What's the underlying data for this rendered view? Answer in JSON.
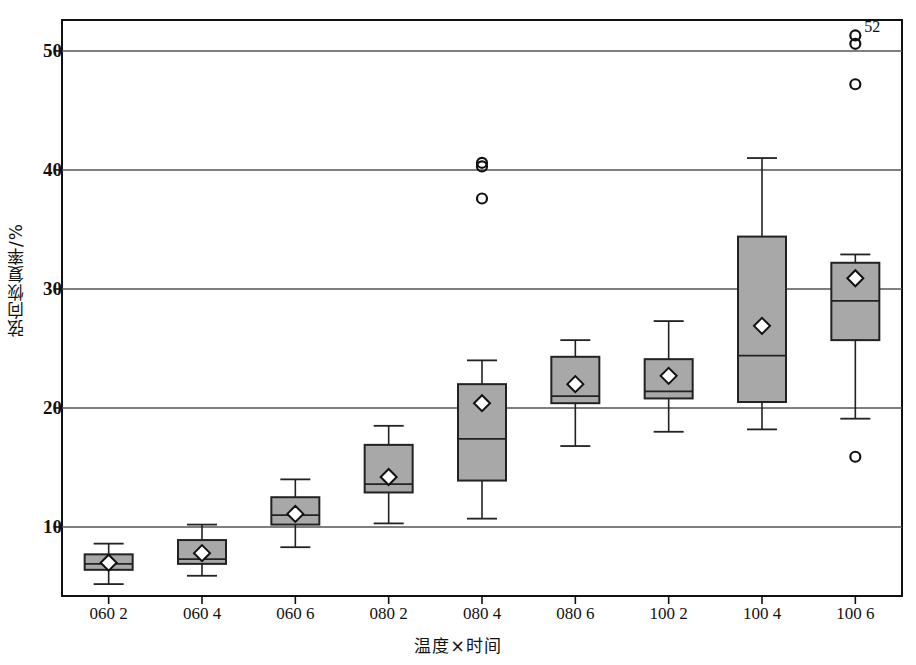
{
  "chart_data": {
    "type": "boxplot",
    "title": "",
    "xlabel": "温度×时间",
    "ylabel": "弦向恢复率/%",
    "categories": [
      "060 2",
      "060 4",
      "060 6",
      "080 2",
      "080 4",
      "080 6",
      "100 2",
      "100 4",
      "100 6"
    ],
    "ylim": [
      4.2,
      52.6
    ],
    "yticks": [
      10,
      20,
      30,
      40,
      50
    ],
    "ytick_labels": [
      "10",
      "20",
      "30",
      "40",
      "50"
    ],
    "grid": "horizontal",
    "legend": "none",
    "box_fill_color": "#a8a8a8",
    "box_edge_color": "#222222",
    "mean_marker": "diamond",
    "boxes": [
      {
        "category": "060 2",
        "whisker_low": 5.2,
        "q1": 6.4,
        "median": 6.9,
        "q3": 7.7,
        "whisker_high": 8.6,
        "mean": 7.0,
        "outliers": []
      },
      {
        "category": "060 4",
        "whisker_low": 5.9,
        "q1": 6.9,
        "median": 7.3,
        "q3": 8.9,
        "whisker_high": 10.2,
        "mean": 7.8,
        "outliers": []
      },
      {
        "category": "060 6",
        "whisker_low": 8.3,
        "q1": 10.2,
        "median": 11.0,
        "q3": 12.5,
        "whisker_high": 14.0,
        "mean": 11.1,
        "outliers": []
      },
      {
        "category": "080 2",
        "whisker_low": 10.3,
        "q1": 12.9,
        "median": 13.6,
        "q3": 16.9,
        "whisker_high": 18.5,
        "mean": 14.2,
        "outliers": []
      },
      {
        "category": "080 4",
        "whisker_low": 10.7,
        "q1": 13.9,
        "median": 17.4,
        "q3": 22.0,
        "whisker_high": 24.0,
        "mean": 20.4,
        "outliers": [
          37.6,
          40.3,
          40.6
        ]
      },
      {
        "category": "080 6",
        "whisker_low": 16.8,
        "q1": 20.4,
        "median": 21.0,
        "q3": 24.3,
        "whisker_high": 25.7,
        "mean": 22.0,
        "outliers": []
      },
      {
        "category": "100 2",
        "whisker_low": 18.0,
        "q1": 20.8,
        "median": 21.4,
        "q3": 24.1,
        "whisker_high": 27.3,
        "mean": 22.7,
        "outliers": []
      },
      {
        "category": "100 4",
        "whisker_low": 18.2,
        "q1": 20.5,
        "median": 24.4,
        "q3": 34.4,
        "whisker_high": 41.0,
        "mean": 26.9,
        "outliers": []
      },
      {
        "category": "100 6",
        "whisker_low": 19.1,
        "q1": 25.7,
        "median": 29.0,
        "q3": 32.2,
        "whisker_high": 32.9,
        "mean": 30.9,
        "outliers": [
          15.9,
          47.2,
          50.6,
          51.3
        ]
      }
    ],
    "annotations": [
      {
        "text": "52",
        "value": 51.3,
        "category": "100 6"
      }
    ]
  }
}
